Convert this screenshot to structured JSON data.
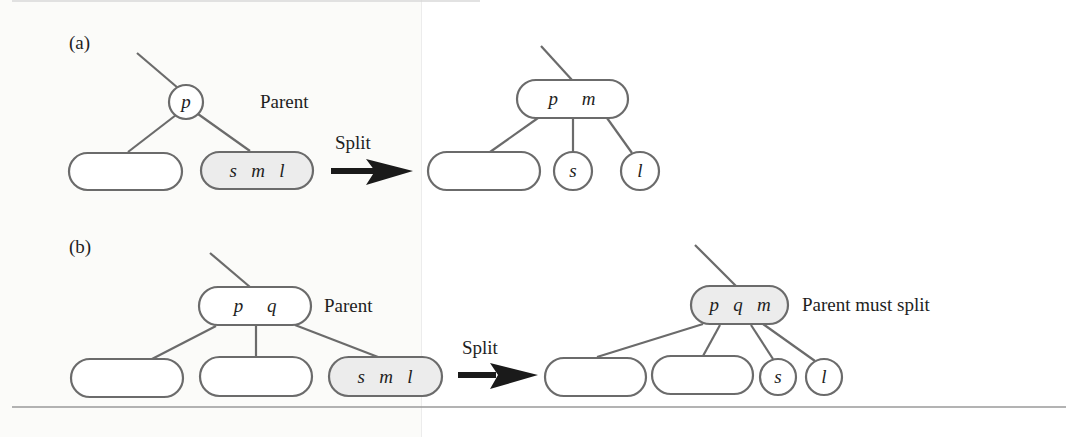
{
  "figure": {
    "colors": {
      "stroke": "#6b6b6b",
      "highlight_fill": "#ececec",
      "arrow": "#1a1a1a",
      "text": "#1e1e1e",
      "rule": "#9a9a9a"
    },
    "panels": [
      {
        "id": "a",
        "label": "(a)",
        "before": {
          "parent": {
            "keys": [
              "p"
            ],
            "shape": "circle",
            "annotation": "Parent"
          },
          "children": [
            {
              "keys": [],
              "highlighted": false
            },
            {
              "keys": [
                "s",
                "m",
                "l"
              ],
              "highlighted": true
            }
          ]
        },
        "arrow_label": "Split",
        "after": {
          "parent": {
            "keys": [
              "p",
              "m"
            ],
            "highlighted": false
          },
          "children": [
            {
              "keys": [],
              "shape": "rounded-rect"
            },
            {
              "keys": [
                "s"
              ],
              "shape": "circle"
            },
            {
              "keys": [
                "l"
              ],
              "shape": "circle"
            }
          ]
        }
      },
      {
        "id": "b",
        "label": "(b)",
        "before": {
          "parent": {
            "keys": [
              "p",
              "q"
            ],
            "annotation": "Parent"
          },
          "children": [
            {
              "keys": [],
              "highlighted": false
            },
            {
              "keys": [],
              "highlighted": false
            },
            {
              "keys": [
                "s",
                "m",
                "l"
              ],
              "highlighted": true
            }
          ]
        },
        "arrow_label": "Split",
        "after": {
          "parent": {
            "keys": [
              "p",
              "q",
              "m"
            ],
            "highlighted": true,
            "annotation": "Parent must split"
          },
          "children": [
            {
              "keys": [],
              "shape": "rounded-rect"
            },
            {
              "keys": [],
              "shape": "rounded-rect"
            },
            {
              "keys": [
                "s"
              ],
              "shape": "circle"
            },
            {
              "keys": [
                "l"
              ],
              "shape": "circle"
            }
          ]
        }
      }
    ]
  },
  "text": {
    "a_label": "(a)",
    "b_label": "(b)",
    "a_parent": "Parent",
    "b_parent": "Parent",
    "b_must_split": "Parent must split",
    "a_split": "Split",
    "b_split": "Split",
    "a_before_parent_key": "p",
    "a_before_leaf_keys": "s   m   l",
    "a_after_parent_keys": "p     m",
    "a_after_s": "s",
    "a_after_l": "l",
    "b_before_parent_keys": "p     q",
    "b_before_leaf_keys": "s   m   l",
    "b_after_parent_keys": "p   q   m",
    "b_after_s": "s",
    "b_after_l": "l"
  }
}
